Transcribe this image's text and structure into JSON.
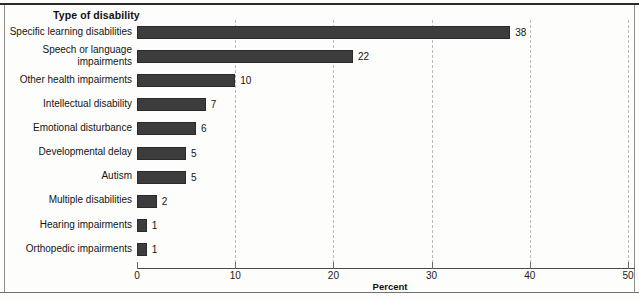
{
  "figure": {
    "axis_title": "Type of disability",
    "xlabel": "Percent",
    "bar_color": "#3c3c3c",
    "grid_color": "#b9b9b9",
    "axis_color": "#4a4a4a"
  },
  "chart_data": {
    "type": "bar",
    "orientation": "horizontal",
    "title": "Type of disability",
    "xlabel": "Percent",
    "ylabel": "Type of disability",
    "xlim": [
      0,
      50
    ],
    "xticks": [
      0,
      10,
      20,
      30,
      40,
      50
    ],
    "xtick_labels": [
      "0",
      "10",
      "20",
      "30",
      "40",
      "50"
    ],
    "grid": "vertical-dashed",
    "legend": "none",
    "categories": [
      "Specific learning disabilities",
      "Speech or language\nimpairments",
      "Other health impairments",
      "Intellectual disability",
      "Emotional disturbance",
      "Developmental delay",
      "Autism",
      "Multiple disabilities",
      "Hearing impairments",
      "Orthopedic impairments"
    ],
    "values": [
      38,
      22,
      10,
      7,
      6,
      5,
      5,
      2,
      1,
      1
    ],
    "value_labels": [
      "38",
      "22",
      "10",
      "7",
      "6",
      "5",
      "5",
      "2",
      "1",
      "1"
    ]
  }
}
